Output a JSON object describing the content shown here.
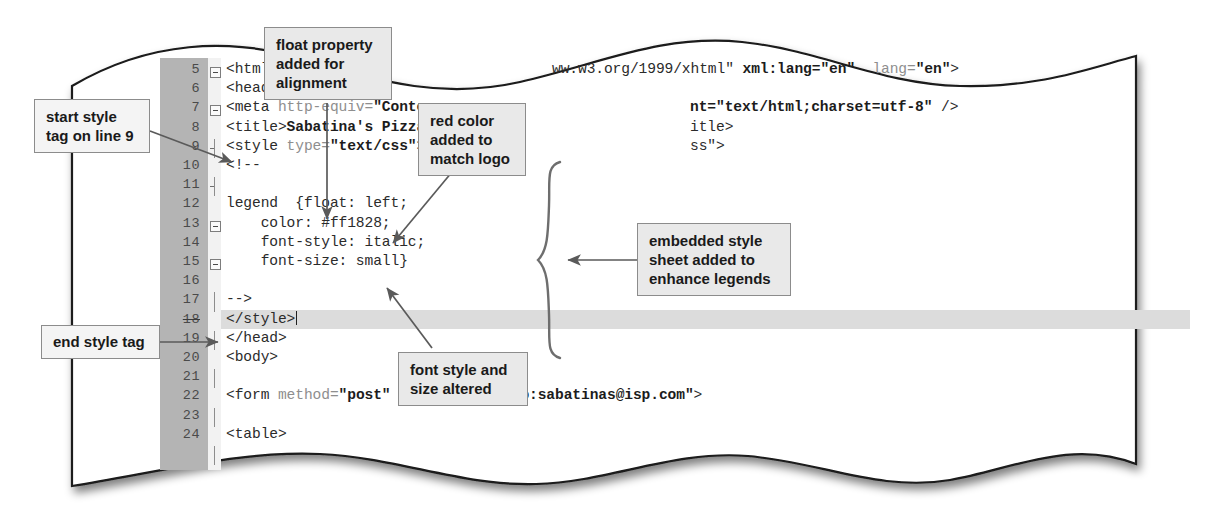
{
  "figure": {
    "kind": "code-editor-screenshot-with-callouts",
    "paper_style": "torn-wavy-edge",
    "colors": {
      "gutter": "#b4b4b4",
      "callout_fill": "#e9e9e9",
      "callout_border": "#8c8c8c",
      "highlight_line": "#dcdcdc",
      "code_text": "#2b2b2b",
      "code_muted": "#8e8e8e"
    }
  },
  "editor": {
    "highlighted_line": 18,
    "caret_line": 18,
    "lines": [
      {
        "num": "5",
        "segments": [
          {
            "t": "<html",
            "s": "plain"
          }
        ],
        "fold": "open"
      },
      {
        "num": "6",
        "segments": [
          {
            "t": "<head",
            "s": "plain"
          }
        ],
        "fold": "open"
      },
      {
        "num": "7",
        "segments": [
          {
            "t": "<meta ",
            "s": "plain"
          },
          {
            "t": "http-equiv=",
            "s": "muted"
          },
          {
            "t": "\"Conte",
            "s": "bold"
          }
        ],
        "fold": "tick"
      },
      {
        "num": "8",
        "segments": [
          {
            "t": "<title>",
            "s": "plain"
          },
          {
            "t": "Sabatina's Pizza",
            "s": "bold"
          }
        ],
        "fold": "tick"
      },
      {
        "num": "9",
        "segments": [
          {
            "t": "<style ",
            "s": "plain"
          },
          {
            "t": "type=",
            "s": "muted"
          },
          {
            "t": "\"text/css\"",
            "s": "bold"
          },
          {
            "t": ">",
            "s": "plain"
          }
        ],
        "fold": "open"
      },
      {
        "num": "10",
        "segments": [
          {
            "t": "<!--",
            "s": "plain"
          }
        ],
        "fold": "open"
      },
      {
        "num": "11",
        "segments": [],
        "fold": "rail"
      },
      {
        "num": "12",
        "segments": [
          {
            "t": "legend  {float: left;",
            "s": "plain"
          }
        ],
        "fold": "rail"
      },
      {
        "num": "13",
        "segments": [
          {
            "t": "    color: #ff1828;",
            "s": "plain"
          }
        ],
        "fold": "rail"
      },
      {
        "num": "14",
        "segments": [
          {
            "t": "    font-style: italic;",
            "s": "plain"
          }
        ],
        "fold": "rail"
      },
      {
        "num": "15",
        "segments": [
          {
            "t": "    font-size: small}",
            "s": "plain"
          }
        ],
        "fold": "rail"
      },
      {
        "num": "16",
        "segments": [],
        "fold": "rail"
      },
      {
        "num": "17",
        "segments": [
          {
            "t": "-->",
            "s": "plain"
          }
        ],
        "fold": "tick"
      },
      {
        "num": "18",
        "segments": [
          {
            "t": "</style>",
            "s": "plain"
          }
        ],
        "fold": "arrow",
        "struck": true
      },
      {
        "num": "19",
        "segments": [
          {
            "t": "</head>",
            "s": "plain"
          }
        ],
        "fold": "tick"
      },
      {
        "num": "20",
        "segments": [
          {
            "t": "<body>",
            "s": "plain"
          }
        ],
        "fold": "open"
      },
      {
        "num": "21",
        "segments": [],
        "fold": "rail"
      },
      {
        "num": "22",
        "segments": [
          {
            "t": "<form ",
            "s": "plain"
          },
          {
            "t": "method=",
            "s": "muted"
          },
          {
            "t": "\"post\"",
            "s": "bold"
          },
          {
            "t": "  ",
            "s": "plain"
          },
          {
            "t": "action=",
            "s": "muted"
          },
          {
            "t": "\"mailto:sabatinas@isp.com\"",
            "s": "bold"
          },
          {
            "t": ">",
            "s": "plain"
          }
        ],
        "fold": "open"
      },
      {
        "num": "23",
        "segments": [],
        "fold": "rail"
      },
      {
        "num": "24",
        "segments": [
          {
            "t": "<table>",
            "s": "plain"
          }
        ],
        "fold": "open"
      }
    ],
    "line5_tail": "ww.w3.org/1999/xhtml\" xml:lang=\"en\"  lang=\"en\">",
    "line7_tail": "nt=\"text/html;charset=utf-8\" />",
    "line8_tail": "itle>",
    "line9_tail": "ss\">"
  },
  "callouts": {
    "float_property": "float property\nadded for\nalignment",
    "red_color": "red color\nadded to\nmatch logo",
    "embedded_sheet": "embedded style\nsheet added to\nenhance legends",
    "start_style_tag": "start style\ntag on line 9",
    "end_style_tag": "end style tag",
    "font_style_size": "font style and\nsize altered"
  }
}
